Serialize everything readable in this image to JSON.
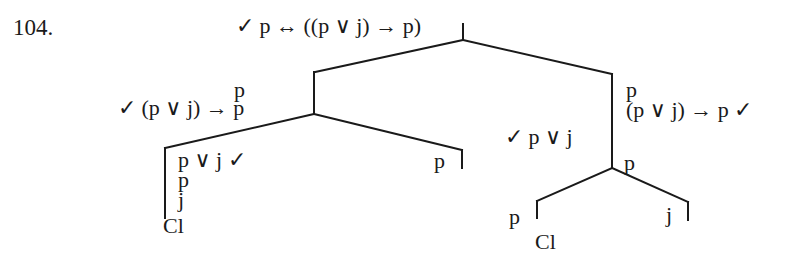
{
  "problem_number": "104.",
  "tree": {
    "root": {
      "formula": "✓  p ↔ ((p ∨ j) → p)"
    },
    "left_branch": {
      "top_label": "p",
      "formula": "✓  (p ∨ j) → p",
      "left_child": {
        "lines": [
          "p ∨ j  ✓",
          "p",
          "j"
        ],
        "closed": "Cl"
      },
      "right_child": {
        "label": "p"
      }
    },
    "right_branch": {
      "lines": [
        "p",
        "(p ∨ j) → p  ✓"
      ],
      "side_formula": "✓  p ∨ j",
      "node_label": "p",
      "left_child": {
        "label": "p",
        "closed": "Cl"
      },
      "right_child": {
        "label": "j"
      }
    }
  },
  "colors": {
    "ink": "#1a1a1a",
    "background": "#ffffff"
  }
}
